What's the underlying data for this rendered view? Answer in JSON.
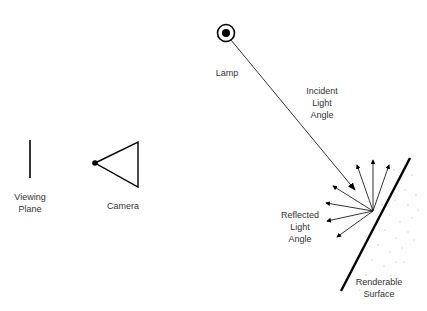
{
  "diagram": {
    "labels": {
      "lamp": "Lamp",
      "incident": "Incident\nLight\nAngle",
      "viewing_plane": "Viewing\nPlane",
      "camera": "Camera",
      "reflected": "Reflected\nLight\nAngle",
      "surface": "Renderable\nSurface"
    },
    "nodes": [
      {
        "id": "lamp",
        "label": "Lamp",
        "icon": "lamp-icon"
      },
      {
        "id": "viewing_plane",
        "label": "Viewing Plane",
        "icon": "line"
      },
      {
        "id": "camera",
        "label": "Camera",
        "icon": "camera-icon"
      },
      {
        "id": "surface",
        "label": "Renderable Surface",
        "icon": "surface"
      }
    ],
    "edges": [
      {
        "from": "lamp",
        "to": "surface",
        "label": "Incident Light Angle"
      },
      {
        "from": "surface",
        "to": "scatter",
        "label": "Reflected Light Angle",
        "count": 7
      }
    ],
    "colors": {
      "stroke": "#000000",
      "text": "#333333",
      "stipple": "#bbbbbb"
    }
  }
}
